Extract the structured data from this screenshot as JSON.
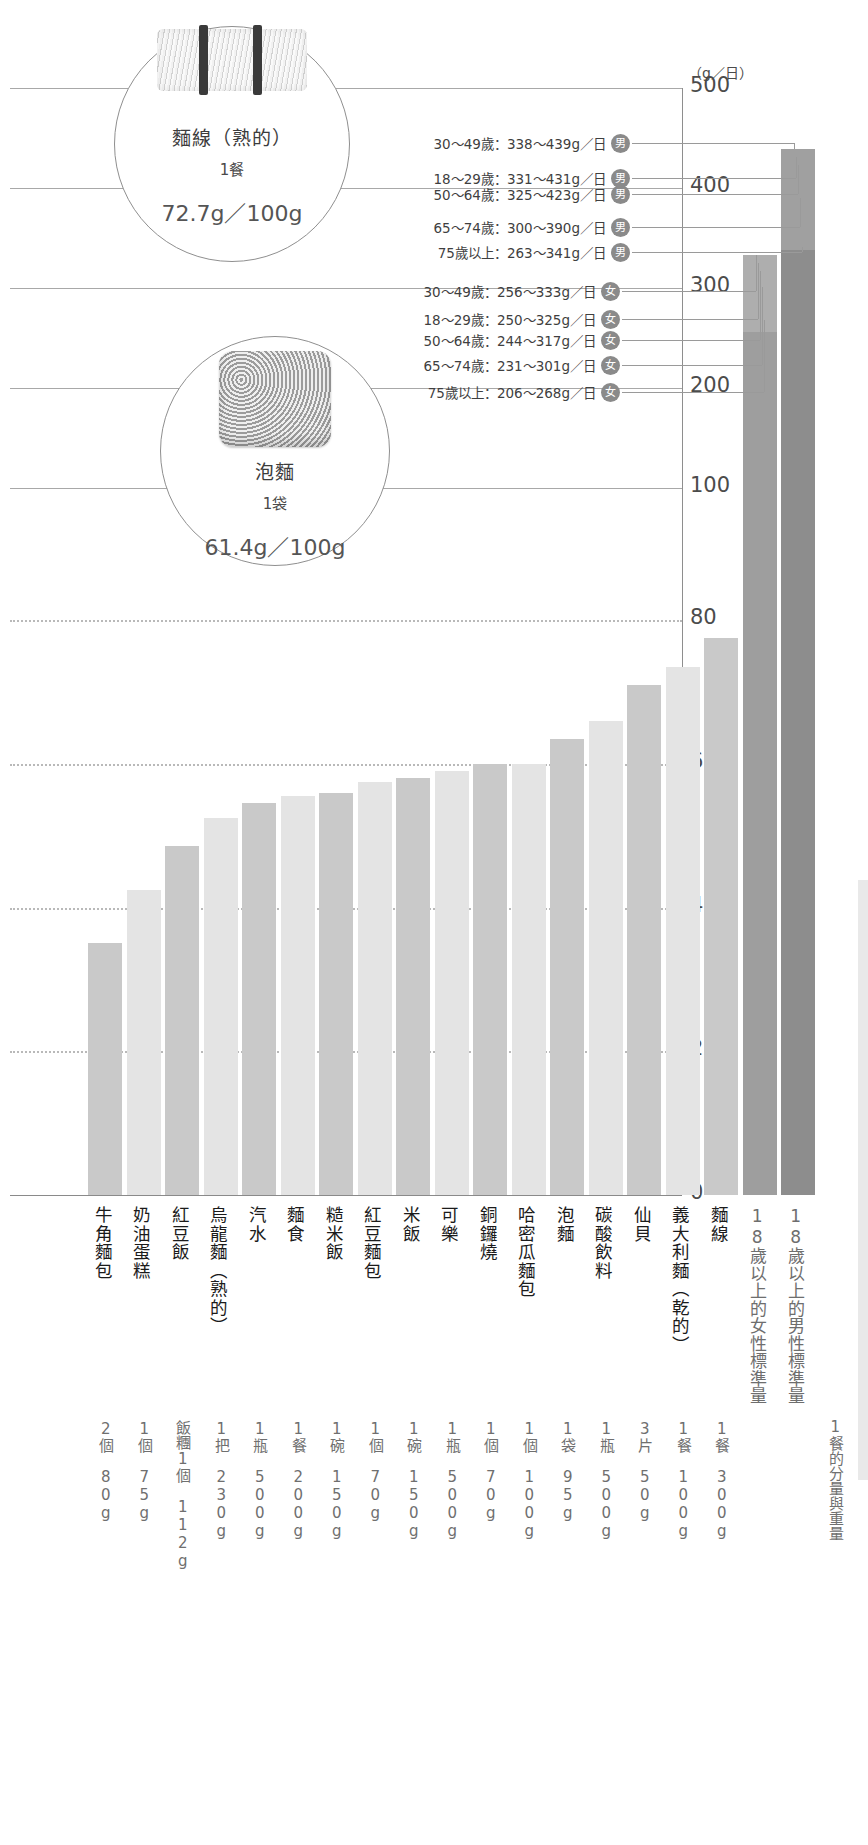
{
  "unit_label": "（g／日）",
  "chart_data": {
    "type": "bar",
    "title": "",
    "xlabel": "",
    "ylabel": "（g／日）",
    "ylim_lower": [
      0,
      100
    ],
    "ylim_upper": [
      100,
      500
    ],
    "grid": true,
    "axis_note": "broken axis: lower section 0-100 with dotted gridlines at 20/40/60/80, upper section 100-500 with solid gridlines at 100/200/300/400/500",
    "yticks_lower": [
      "0",
      "20",
      "40",
      "60",
      "80"
    ],
    "yticks_upper": [
      "100",
      "200",
      "300",
      "400",
      "500"
    ],
    "categories": [
      "牛角麵包",
      "奶油蛋糕",
      "紅豆飯",
      "烏龍麵（熟的）",
      "汽水",
      "麵食",
      "糙米飯",
      "紅豆麵包",
      "米飯",
      "可樂",
      "銅鑼燒",
      "哈密瓜麵包",
      "泡麵",
      "碳酸飲料",
      "仙貝",
      "義大利麵（乾的）",
      "麵線",
      "18歲以上的女性標準量",
      "18歲以上的男性標準量"
    ],
    "values": [
      35,
      42.5,
      48.5,
      52.5,
      54.5,
      55.5,
      56,
      57.5,
      58,
      59,
      60,
      60,
      63.5,
      66,
      71,
      73.5,
      77.5,
      333,
      439
    ],
    "portions": [
      {
        "unit": "2個",
        "weight": "80g"
      },
      {
        "unit": "1個",
        "weight": "75g"
      },
      {
        "unit": "飯糰1個",
        "weight": "112g"
      },
      {
        "unit": "1把",
        "weight": "230g"
      },
      {
        "unit": "1瓶",
        "weight": "500g"
      },
      {
        "unit": "1餐",
        "weight": "200g"
      },
      {
        "unit": "1碗",
        "weight": "150g"
      },
      {
        "unit": "1個",
        "weight": "70g"
      },
      {
        "unit": "1碗",
        "weight": "150g"
      },
      {
        "unit": "1瓶",
        "weight": "500g"
      },
      {
        "unit": "1個",
        "weight": "70g"
      },
      {
        "unit": "1個",
        "weight": "100g"
      },
      {
        "unit": "1袋",
        "weight": "95g"
      },
      {
        "unit": "1瓶",
        "weight": "500g"
      },
      {
        "unit": "3片",
        "weight": "50g"
      },
      {
        "unit": "1餐",
        "weight": "100g"
      },
      {
        "unit": "1餐",
        "weight": "300g"
      },
      {
        "unit": "",
        "weight": ""
      },
      {
        "unit": "",
        "weight": ""
      }
    ],
    "portion_note": "1餐的分量與重量"
  },
  "callouts": [
    {
      "icon": "noodle-bundle-icon",
      "title": "麵線（熟的）",
      "sub": "1餐",
      "value": "72.7g／100g"
    },
    {
      "icon": "instant-ramen-icon",
      "title": "泡麵",
      "sub": "1袋",
      "value": "61.4g／100g"
    }
  ],
  "annotations": {
    "male": [
      {
        "text": "30～49歲：338～439g／日",
        "badge": "男"
      },
      {
        "text": "18～29歲：331～431g／日",
        "badge": "男"
      },
      {
        "text": "50～64歲：325～423g／日",
        "badge": "男"
      },
      {
        "text": "65～74歲：300～390g／日",
        "badge": "男"
      },
      {
        "text": "75歲以上：263～341g／日",
        "badge": "男"
      }
    ],
    "female": [
      {
        "text": "30～49歲：256～333g／日",
        "badge": "女"
      },
      {
        "text": "18～29歲：250～325g／日",
        "badge": "女"
      },
      {
        "text": "50～64歲：244～317g／日",
        "badge": "女"
      },
      {
        "text": "65～74歲：231～301g／日",
        "badge": "女"
      },
      {
        "text": "75歲以上：206～268g／日",
        "badge": "女"
      }
    ]
  },
  "colors": {
    "bar_dark": "#c9c9c9",
    "bar_light": "#e4e4e4",
    "bar_std_female": "#9e9e9e",
    "bar_std_male": "#8d8d8d",
    "axis": "#8e8e8e",
    "text": "#3f3f3f"
  }
}
